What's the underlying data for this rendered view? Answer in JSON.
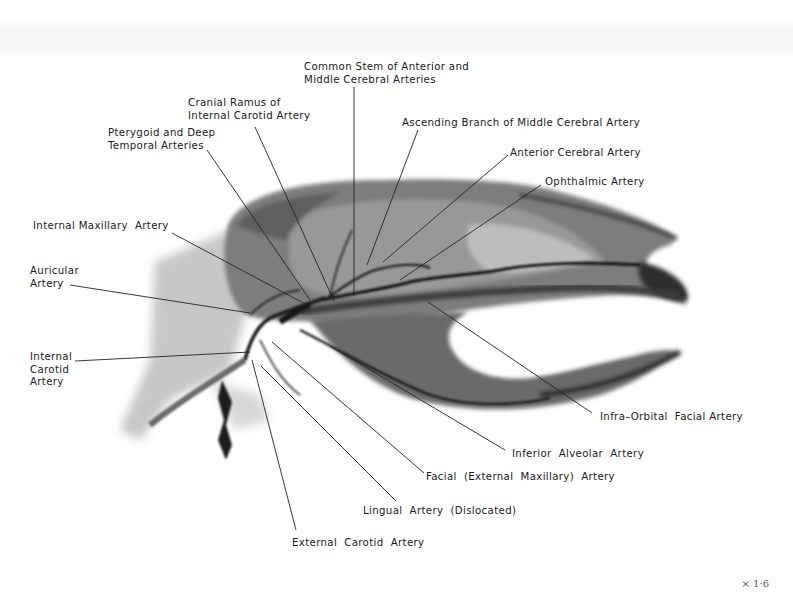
{
  "figure": {
    "magnification": "× 1·6"
  },
  "labels": [
    {
      "id": "common-stem",
      "text": "Common Stem of Anterior and\nMiddle Cerebral Arteries",
      "x": 304,
      "y": 61,
      "line": [
        [
          354,
          87
        ],
        [
          354,
          296
        ]
      ]
    },
    {
      "id": "cranial-ramus",
      "text": "Cranial Ramus of\nInternal Carotid Artery",
      "x": 188,
      "y": 97,
      "line": [
        [
          255,
          127
        ],
        [
          334,
          301
        ]
      ]
    },
    {
      "id": "pterygoid-deep-temporal",
      "text": "Pterygoid and Deep\nTemporal Arteries",
      "x": 108,
      "y": 127,
      "line": [
        [
          207,
          150
        ],
        [
          310,
          300
        ]
      ]
    },
    {
      "id": "ascending-branch-mca",
      "text": "Ascending Branch of Middle Cerebral Artery",
      "x": 402,
      "y": 117,
      "line": [
        [
          418,
          130
        ],
        [
          367,
          265
        ]
      ]
    },
    {
      "id": "anterior-cerebral",
      "text": "Anterior Cerebral Artery",
      "x": 510,
      "y": 147,
      "line": [
        [
          508,
          155
        ],
        [
          383,
          262
        ]
      ]
    },
    {
      "id": "ophthalmic",
      "text": "Ophthalmic Artery",
      "x": 545,
      "y": 176,
      "line": [
        [
          541,
          185
        ],
        [
          400,
          280
        ]
      ]
    },
    {
      "id": "internal-maxillary",
      "text": "Internal Maxillary  Artery",
      "x": 33,
      "y": 220,
      "line": [
        [
          172,
          233
        ],
        [
          309,
          306
        ]
      ]
    },
    {
      "id": "auricular",
      "text": "Auricular\nArtery",
      "x": 30,
      "y": 265,
      "line": [
        [
          70,
          285
        ],
        [
          250,
          313
        ]
      ]
    },
    {
      "id": "internal-carotid",
      "text": "Internal\nCarotid\nArtery",
      "x": 30,
      "y": 351,
      "line": [
        [
          75,
          361
        ],
        [
          250,
          352
        ]
      ]
    },
    {
      "id": "infra-orbital-facial",
      "text": "Infra–Orbital  Facial Artery",
      "x": 600,
      "y": 411,
      "line": [
        [
          592,
          413
        ],
        [
          428,
          302
        ]
      ]
    },
    {
      "id": "inferior-alveolar",
      "text": "Inferior  Alveolar  Artery",
      "x": 512,
      "y": 448,
      "line": [
        [
          505,
          450
        ],
        [
          330,
          346
        ]
      ]
    },
    {
      "id": "facial-external-maxillary",
      "text": "Facial  (External  Maxillary)  Artery",
      "x": 426,
      "y": 471,
      "line": [
        [
          424,
          473
        ],
        [
          272,
          342
        ]
      ]
    },
    {
      "id": "lingual-dislocated",
      "text": "Lingual  Artery  (Dislocated)",
      "x": 363,
      "y": 505,
      "line": [
        [
          396,
          501
        ],
        [
          261,
          366
        ]
      ]
    },
    {
      "id": "external-carotid",
      "text": "External  Carotid  Artery",
      "x": 292,
      "y": 537,
      "line": [
        [
          296,
          530
        ],
        [
          252,
          360
        ]
      ]
    }
  ]
}
